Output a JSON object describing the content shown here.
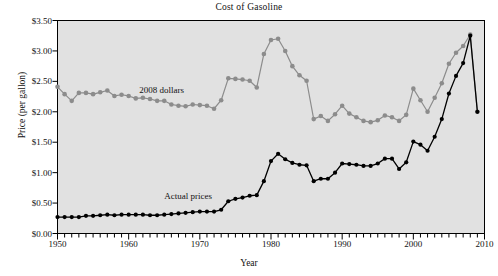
{
  "chart_data": {
    "type": "line",
    "title": "Cost of Gasoline",
    "xlabel": "Year",
    "ylabel": "Price (per gallon)",
    "xlim": [
      1950,
      2010
    ],
    "ylim": [
      0.0,
      3.5
    ],
    "ytick_values": [
      0.0,
      0.5,
      1.0,
      1.5,
      2.0,
      2.5,
      3.0,
      3.5
    ],
    "ytick_labels": [
      "$0.00",
      "$0.50",
      "$1.00",
      "$1.50",
      "$2.00",
      "$2.50",
      "$3.00",
      "$3.50"
    ],
    "xtick_values": [
      1950,
      1960,
      1970,
      1980,
      1990,
      2000,
      2010
    ],
    "xtick_labels": [
      "1950",
      "1960",
      "1970",
      "1980",
      "1990",
      "2000",
      "2010"
    ],
    "minor_xtick_step": 1,
    "grid": false,
    "legend": "inline-annotations",
    "plot_background": "#e1e1e1",
    "axes_border": "#000000",
    "annotations": [
      {
        "text": "2008 dollars",
        "x": 1961.5,
        "y": 2.34,
        "color": "#111111"
      },
      {
        "text": "Actual prices",
        "x": 1965.0,
        "y": 0.6,
        "color": "#111111"
      }
    ],
    "series": [
      {
        "name": "2008 dollars",
        "color": "#8c8c8c",
        "marker": "circle",
        "x": [
          1950,
          1951,
          1952,
          1953,
          1954,
          1955,
          1956,
          1957,
          1958,
          1959,
          1960,
          1961,
          1962,
          1963,
          1964,
          1965,
          1966,
          1967,
          1968,
          1969,
          1970,
          1971,
          1972,
          1973,
          1974,
          1975,
          1976,
          1977,
          1978,
          1979,
          1980,
          1981,
          1982,
          1983,
          1984,
          1985,
          1986,
          1987,
          1988,
          1989,
          1990,
          1991,
          1992,
          1993,
          1994,
          1995,
          1996,
          1997,
          1998,
          1999,
          2000,
          2001,
          2002,
          2003,
          2004,
          2005,
          2006,
          2007,
          2008,
          2009
        ],
        "values": [
          2.41,
          2.29,
          2.18,
          2.31,
          2.31,
          2.29,
          2.32,
          2.35,
          2.26,
          2.28,
          2.26,
          2.22,
          2.23,
          2.21,
          2.18,
          2.18,
          2.12,
          2.1,
          2.09,
          2.12,
          2.11,
          2.1,
          2.05,
          2.19,
          2.55,
          2.54,
          2.53,
          2.51,
          2.4,
          2.95,
          3.18,
          3.2,
          3.0,
          2.75,
          2.6,
          2.51,
          1.88,
          1.93,
          1.85,
          1.96,
          2.1,
          1.97,
          1.91,
          1.85,
          1.83,
          1.86,
          1.94,
          1.91,
          1.85,
          1.95,
          2.38,
          2.19,
          2.0,
          2.23,
          2.47,
          2.79,
          2.97,
          3.08,
          3.27,
          2.0
        ]
      },
      {
        "name": "Actual prices",
        "color": "#000000",
        "marker": "circle",
        "x": [
          1950,
          1951,
          1952,
          1953,
          1954,
          1955,
          1956,
          1957,
          1958,
          1959,
          1960,
          1961,
          1962,
          1963,
          1964,
          1965,
          1966,
          1967,
          1968,
          1969,
          1970,
          1971,
          1972,
          1973,
          1974,
          1975,
          1976,
          1977,
          1978,
          1979,
          1980,
          1981,
          1982,
          1983,
          1984,
          1985,
          1986,
          1987,
          1988,
          1989,
          1990,
          1991,
          1992,
          1993,
          1994,
          1995,
          1996,
          1997,
          1998,
          1999,
          2000,
          2001,
          2002,
          2003,
          2004,
          2005,
          2006,
          2007,
          2008,
          2009
        ],
        "values": [
          0.27,
          0.27,
          0.27,
          0.27,
          0.29,
          0.29,
          0.3,
          0.31,
          0.3,
          0.31,
          0.31,
          0.31,
          0.31,
          0.3,
          0.3,
          0.31,
          0.32,
          0.33,
          0.34,
          0.35,
          0.36,
          0.36,
          0.36,
          0.39,
          0.53,
          0.57,
          0.59,
          0.62,
          0.63,
          0.86,
          1.19,
          1.31,
          1.22,
          1.16,
          1.13,
          1.12,
          0.86,
          0.9,
          0.9,
          1.0,
          1.15,
          1.14,
          1.13,
          1.11,
          1.11,
          1.15,
          1.23,
          1.23,
          1.06,
          1.17,
          1.51,
          1.46,
          1.36,
          1.59,
          1.88,
          2.3,
          2.59,
          2.8,
          3.25,
          2.0
        ]
      }
    ]
  }
}
